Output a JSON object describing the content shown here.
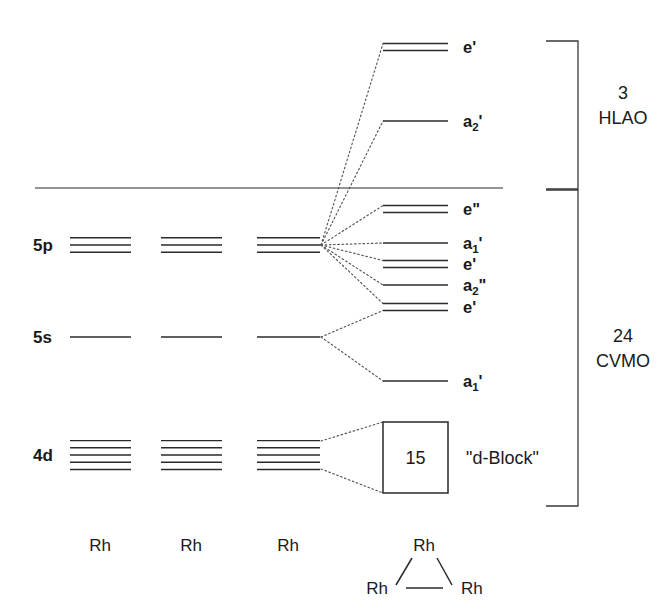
{
  "diagram": {
    "axis_line_label": "energy-reference-line"
  },
  "atomic_levels": {
    "labels": [
      {
        "id": "5p",
        "text": "5p",
        "lines": 3,
        "y": 245
      },
      {
        "id": "5s",
        "text": "5s",
        "lines": 1,
        "y": 337
      },
      {
        "id": "4d",
        "text": "4d",
        "lines": 5,
        "y": 455
      }
    ]
  },
  "columns": {
    "atom_labels": [
      "Rh",
      "Rh",
      "Rh",
      "Rh"
    ]
  },
  "mo_levels": [
    {
      "id": "mo-e-prime-top",
      "base": "e",
      "sub": "",
      "prime": "'",
      "lines": 2,
      "y": 47,
      "region": "HLAO"
    },
    {
      "id": "mo-a2-prime",
      "base": "a",
      "sub": "2",
      "prime": "'",
      "lines": 1,
      "y": 121,
      "region": "HLAO"
    },
    {
      "id": "mo-e-dprime",
      "base": "e",
      "sub": "",
      "prime": "\"",
      "lines": 2,
      "y": 209,
      "region": "CVMO"
    },
    {
      "id": "mo-a1-prime-up",
      "base": "a",
      "sub": "1",
      "prime": "'",
      "lines": 1,
      "y": 243,
      "region": "CVMO"
    },
    {
      "id": "mo-e-prime-mid",
      "base": "e",
      "sub": "",
      "prime": "'",
      "lines": 2,
      "y": 264,
      "region": "CVMO"
    },
    {
      "id": "mo-a2-dprime",
      "base": "a",
      "sub": "2",
      "prime": "\"",
      "lines": 1,
      "y": 285,
      "region": "CVMO"
    },
    {
      "id": "mo-e-prime-low",
      "base": "e",
      "sub": "",
      "prime": "'",
      "lines": 2,
      "y": 307,
      "region": "CVMO"
    },
    {
      "id": "mo-a1-prime-low",
      "base": "a",
      "sub": "1",
      "prime": "'",
      "lines": 1,
      "y": 381,
      "region": "CVMO"
    }
  ],
  "dblock": {
    "count": "15",
    "label": "\"d-Block\""
  },
  "brackets": [
    {
      "id": "hlao",
      "count": "3",
      "name": "HLAO"
    },
    {
      "id": "cvmo",
      "count": "24",
      "name": "CVMO"
    }
  ],
  "molecule": {
    "vertices": [
      "Rh",
      "Rh",
      "Rh"
    ]
  },
  "colors": {
    "ink": "#1a1a1a",
    "line": "#2a2a2a",
    "dotted": "#555555"
  }
}
